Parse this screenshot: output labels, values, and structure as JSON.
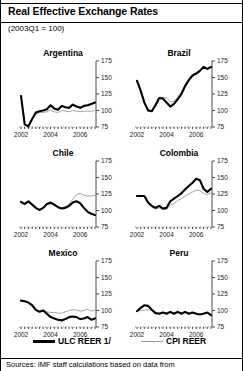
{
  "header": {
    "title": "Real Effective Exchange Rates",
    "subtitle": "(2003Q1 = 100)"
  },
  "legend": {
    "ulc_label": "ULC REER 1/",
    "cpi_label": "CPI REER",
    "ulc_color": "#000000",
    "cpi_color": "#9a9a9a"
  },
  "source": {
    "text": "Sources: IMF staff calculations based on data from"
  },
  "chart_data": {
    "type": "line",
    "title": "Real Effective Exchange Rates",
    "subtitle": "(2003Q1 = 100)",
    "xlabel": "",
    "ylabel": "",
    "ylim": [
      75,
      175
    ],
    "yticks": [
      75,
      100,
      125,
      150,
      175
    ],
    "xlim": [
      2002.0,
      2007.0
    ],
    "xticks": [
      2002,
      2004,
      2006
    ],
    "xtick_labels": [
      "2002",
      "2004",
      "2006"
    ],
    "grid": false,
    "legend_position": "bottom",
    "series_names": [
      "ULC REER 1/",
      "CPI REER"
    ],
    "panels": [
      {
        "name": "Argentina",
        "x": [
          2002.0,
          2002.25,
          2002.5,
          2002.75,
          2003.0,
          2003.25,
          2003.5,
          2003.75,
          2004.0,
          2004.25,
          2004.5,
          2004.75,
          2005.0,
          2005.25,
          2005.5,
          2005.75,
          2006.0,
          2006.25,
          2006.5,
          2006.75,
          2007.0
        ],
        "series": [
          {
            "name": "ULC REER 1/",
            "values": [
              122,
              79,
              76,
              87,
              97,
              99,
              100,
              102,
              108,
              103,
              101,
              107,
              105,
              104,
              109,
              106,
              104,
              107,
              108,
              110,
              112
            ]
          },
          {
            "name": "CPI REER",
            "values": [
              122,
              79,
              76,
              86,
              95,
              97,
              97,
              98,
              101,
              98,
              97,
              100,
              99,
              98,
              100,
              99,
              98,
              99,
              99,
              99,
              100
            ]
          }
        ]
      },
      {
        "name": "Brazil",
        "x": [
          2002.0,
          2002.25,
          2002.5,
          2002.75,
          2003.0,
          2003.25,
          2003.5,
          2003.75,
          2004.0,
          2004.25,
          2004.5,
          2004.75,
          2005.0,
          2005.25,
          2005.5,
          2005.75,
          2006.0,
          2006.25,
          2006.5,
          2006.75,
          2007.0
        ],
        "series": [
          {
            "name": "ULC REER 1/",
            "values": [
              145,
              130,
              112,
              100,
              99,
              108,
              119,
              118,
              112,
              106,
              110,
              117,
              125,
              137,
              146,
              153,
              156,
              160,
              166,
              163,
              166
            ]
          },
          {
            "name": "CPI REER",
            "values": [
              145,
              132,
              113,
              101,
              100,
              110,
              120,
              120,
              119,
              113,
              114,
              120,
              128,
              139,
              147,
              153,
              157,
              161,
              165,
              162,
              165
            ]
          }
        ]
      },
      {
        "name": "Chile",
        "x": [
          2002.0,
          2002.25,
          2002.5,
          2002.75,
          2003.0,
          2003.25,
          2003.5,
          2003.75,
          2004.0,
          2004.25,
          2004.5,
          2004.75,
          2005.0,
          2005.25,
          2005.5,
          2005.75,
          2006.0,
          2006.25,
          2006.5,
          2006.75,
          2007.0
        ],
        "series": [
          {
            "name": "ULC REER 1/",
            "values": [
              113,
              110,
              114,
              109,
              104,
              101,
              104,
              110,
              112,
              109,
              105,
              103,
              104,
              107,
              112,
              114,
              111,
              104,
              98,
              95,
              93
            ]
          },
          {
            "name": "CPI REER",
            "values": [
              110,
              109,
              112,
              108,
              103,
              100,
              103,
              108,
              110,
              108,
              105,
              104,
              106,
              110,
              117,
              124,
              126,
              123,
              122,
              122,
              123
            ]
          }
        ]
      },
      {
        "name": "Colombia",
        "x": [
          2002.0,
          2002.25,
          2002.5,
          2002.75,
          2003.0,
          2003.25,
          2003.5,
          2003.75,
          2004.0,
          2004.25,
          2004.5,
          2004.75,
          2005.0,
          2005.25,
          2005.5,
          2005.75,
          2006.0,
          2006.25,
          2006.5,
          2006.75,
          2007.0
        ],
        "series": [
          {
            "name": "ULC REER 1/",
            "values": [
              122,
              122,
              122,
              112,
              107,
              104,
              107,
              103,
              104,
              114,
              118,
              122,
              126,
              132,
              137,
              142,
              148,
              146,
              133,
              128,
              133
            ]
          },
          {
            "name": "CPI REER",
            "values": [
              122,
              122,
              121,
              111,
              105,
              102,
              104,
              101,
              102,
              108,
              111,
              115,
              118,
              122,
              125,
              128,
              131,
              130,
              126,
              124,
              127
            ]
          }
        ]
      },
      {
        "name": "Mexico",
        "x": [
          2002.0,
          2002.25,
          2002.5,
          2002.75,
          2003.0,
          2003.25,
          2003.5,
          2003.75,
          2004.0,
          2004.25,
          2004.5,
          2004.75,
          2005.0,
          2005.25,
          2005.5,
          2005.75,
          2006.0,
          2006.25,
          2006.5,
          2006.75,
          2007.0
        ],
        "series": [
          {
            "name": "ULC REER 1/",
            "values": [
              115,
              114,
              112,
              108,
              101,
              98,
              100,
              95,
              90,
              88,
              86,
              85,
              87,
              90,
              91,
              90,
              87,
              88,
              90,
              86,
              88
            ]
          },
          {
            "name": "CPI REER",
            "values": [
              115,
              114,
              112,
              108,
              101,
              99,
              101,
              98,
              97,
              97,
              96,
              96,
              98,
              100,
              101,
              101,
              99,
              100,
              102,
              99,
              101
            ]
          }
        ]
      },
      {
        "name": "Peru",
        "x": [
          2002.0,
          2002.25,
          2002.5,
          2002.75,
          2003.0,
          2003.25,
          2003.5,
          2003.75,
          2004.0,
          2004.25,
          2004.5,
          2004.75,
          2005.0,
          2005.25,
          2005.5,
          2005.75,
          2006.0,
          2006.25,
          2006.5,
          2006.75,
          2007.0
        ],
        "series": [
          {
            "name": "ULC REER 1/",
            "values": [
              99,
              104,
              108,
              107,
              101,
              96,
              95,
              97,
              95,
              98,
              95,
              98,
              95,
              98,
              95,
              97,
              95,
              94,
              95,
              97,
              93
            ]
          },
          {
            "name": "CPI REER",
            "values": [
              99,
              100,
              100,
              101,
              100,
              97,
              96,
              97,
              96,
              97,
              96,
              97,
              96,
              97,
              96,
              97,
              96,
              95,
              96,
              97,
              94
            ]
          }
        ]
      }
    ]
  }
}
